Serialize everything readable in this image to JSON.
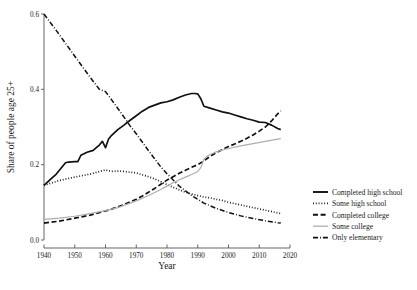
{
  "chart_data": {
    "type": "line",
    "title": "",
    "xlabel": "Year",
    "ylabel": "Share of people age 25+",
    "xlim": [
      1940,
      2020
    ],
    "ylim": [
      0.0,
      0.6
    ],
    "xticks": [
      1940,
      1950,
      1960,
      1970,
      1980,
      1990,
      2000,
      2010,
      2020
    ],
    "yticks": [
      0.0,
      0.2,
      0.4,
      0.6
    ],
    "ytick_labels": [
      "0.0",
      "0.2",
      "0.4",
      "0.6"
    ],
    "xtick_labels": [
      "1940",
      "1950",
      "1960",
      "1970",
      "1980",
      "1990",
      "2000",
      "2010",
      "2020"
    ],
    "grid": false,
    "legend_position": "right",
    "series": [
      {
        "name": "Completed high school",
        "style": "solid",
        "color": "#111111",
        "x": [
          1940,
          1942,
          1944,
          1946,
          1947,
          1948,
          1950,
          1951,
          1952,
          1954,
          1956,
          1957,
          1958,
          1959,
          1960,
          1961,
          1962,
          1964,
          1966,
          1968,
          1970,
          1972,
          1974,
          1976,
          1978,
          1980,
          1982,
          1984,
          1986,
          1988,
          1989,
          1990,
          1991,
          1992,
          1994,
          1996,
          1998,
          2000,
          2002,
          2004,
          2006,
          2008,
          2010,
          2012,
          2014,
          2016,
          2017
        ],
        "y": [
          0.145,
          0.16,
          0.175,
          0.195,
          0.205,
          0.207,
          0.208,
          0.208,
          0.225,
          0.233,
          0.238,
          0.245,
          0.252,
          0.262,
          0.245,
          0.268,
          0.278,
          0.293,
          0.305,
          0.318,
          0.33,
          0.342,
          0.352,
          0.358,
          0.364,
          0.367,
          0.372,
          0.379,
          0.385,
          0.389,
          0.389,
          0.388,
          0.375,
          0.355,
          0.35,
          0.345,
          0.34,
          0.337,
          0.332,
          0.327,
          0.322,
          0.318,
          0.313,
          0.312,
          0.305,
          0.296,
          0.293
        ]
      },
      {
        "name": "Some high school",
        "style": "dotted",
        "color": "#111111",
        "x": [
          1940,
          1945,
          1950,
          1955,
          1960,
          1962,
          1964,
          1966,
          1968,
          1970,
          1972,
          1974,
          1976,
          1978,
          1980,
          1982,
          1984,
          1986,
          1988,
          1990,
          1992,
          1994,
          1996,
          1998,
          2000,
          2004,
          2008,
          2012,
          2016,
          2017
        ],
        "y": [
          0.145,
          0.158,
          0.167,
          0.175,
          0.186,
          0.182,
          0.183,
          0.182,
          0.18,
          0.178,
          0.173,
          0.168,
          0.162,
          0.155,
          0.147,
          0.14,
          0.133,
          0.127,
          0.122,
          0.118,
          0.114,
          0.112,
          0.108,
          0.105,
          0.1,
          0.093,
          0.086,
          0.079,
          0.072,
          0.07
        ]
      },
      {
        "name": "Completed college",
        "style": "dashed",
        "color": "#111111",
        "x": [
          1940,
          1945,
          1950,
          1955,
          1960,
          1962,
          1964,
          1966,
          1968,
          1970,
          1972,
          1974,
          1976,
          1978,
          1980,
          1982,
          1984,
          1986,
          1988,
          1990,
          1992,
          1994,
          1996,
          1998,
          2000,
          2002,
          2004,
          2006,
          2008,
          2010,
          2012,
          2014,
          2016,
          2017
        ],
        "y": [
          0.045,
          0.05,
          0.058,
          0.066,
          0.077,
          0.082,
          0.088,
          0.094,
          0.101,
          0.108,
          0.117,
          0.127,
          0.137,
          0.148,
          0.159,
          0.168,
          0.177,
          0.185,
          0.193,
          0.2,
          0.21,
          0.222,
          0.232,
          0.24,
          0.248,
          0.255,
          0.262,
          0.27,
          0.279,
          0.289,
          0.3,
          0.316,
          0.335,
          0.343
        ]
      },
      {
        "name": "Some college",
        "style": "solid-gray",
        "color": "#aeaeae",
        "x": [
          1940,
          1945,
          1950,
          1955,
          1960,
          1964,
          1968,
          1970,
          1974,
          1978,
          1980,
          1982,
          1984,
          1986,
          1988,
          1990,
          1991,
          1992,
          1993,
          1994,
          1996,
          1998,
          2000,
          2004,
          2008,
          2012,
          2016,
          2017
        ],
        "y": [
          0.055,
          0.058,
          0.063,
          0.07,
          0.078,
          0.086,
          0.098,
          0.104,
          0.118,
          0.134,
          0.143,
          0.152,
          0.16,
          0.167,
          0.174,
          0.182,
          0.192,
          0.214,
          0.222,
          0.227,
          0.234,
          0.239,
          0.243,
          0.25,
          0.256,
          0.262,
          0.268,
          0.269
        ]
      },
      {
        "name": "Only elementary",
        "style": "dash-dot",
        "color": "#111111",
        "x": [
          1940,
          1945,
          1950,
          1955,
          1958,
          1960,
          1962,
          1965,
          1968,
          1970,
          1974,
          1978,
          1980,
          1984,
          1988,
          1992,
          1996,
          2000,
          2004,
          2008,
          2012,
          2016,
          2017
        ],
        "y": [
          0.6,
          0.545,
          0.488,
          0.432,
          0.4,
          0.394,
          0.372,
          0.338,
          0.303,
          0.282,
          0.237,
          0.194,
          0.176,
          0.143,
          0.118,
          0.098,
          0.084,
          0.073,
          0.064,
          0.057,
          0.051,
          0.046,
          0.045
        ]
      }
    ]
  },
  "legend": {
    "items": [
      {
        "label": "Completed high school",
        "style": "solid"
      },
      {
        "label": "Some high school",
        "style": "dotted"
      },
      {
        "label": "Completed college",
        "style": "dashed"
      },
      {
        "label": "Some college",
        "style": "solid-gray"
      },
      {
        "label": "Only elementary",
        "style": "dash-dot"
      }
    ]
  },
  "axes": {
    "x_title": "Year",
    "y_title": "Share of people age 25+"
  }
}
